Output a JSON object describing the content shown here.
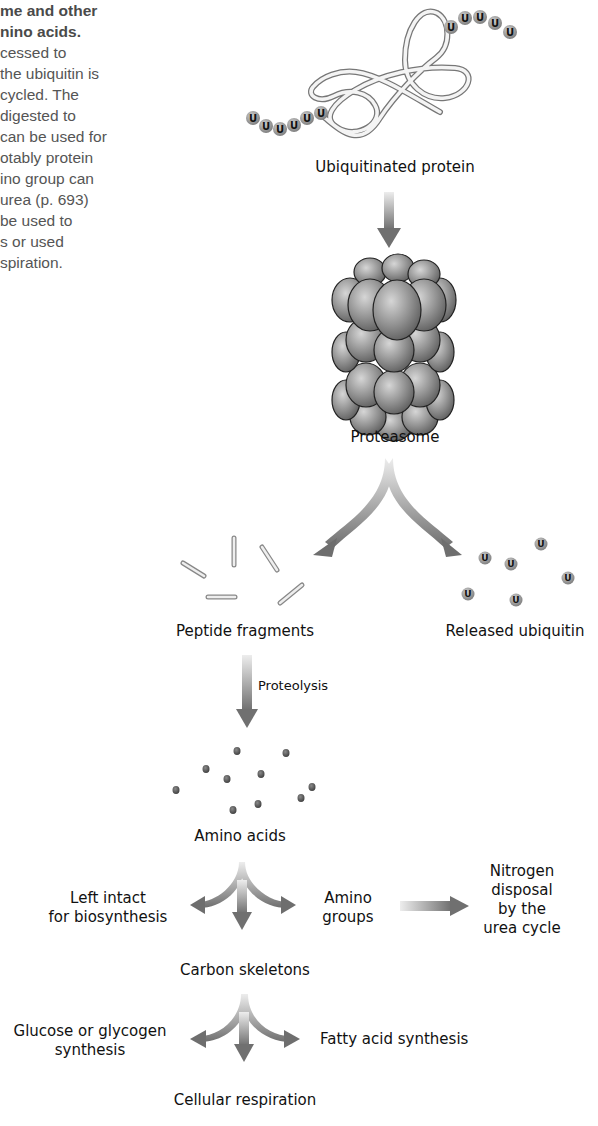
{
  "caption": {
    "lines": [
      {
        "text": "me and other",
        "bold": true
      },
      {
        "text": "nino acids.",
        "bold": true
      },
      {
        "text": "cessed to",
        "bold": false
      },
      {
        "text": " the ubiquitin is",
        "bold": false
      },
      {
        "text": "cycled. The",
        "bold": false
      },
      {
        "text": "digested to",
        "bold": false
      },
      {
        "text": "can be used for",
        "bold": false
      },
      {
        "text": "otably protein",
        "bold": false
      },
      {
        "text": "ino group can",
        "bold": false
      },
      {
        "text": " urea (p. 693)",
        "bold": false
      },
      {
        "text": "be used to",
        "bold": false
      },
      {
        "text": "s or used",
        "bold": false
      },
      {
        "text": "spiration.",
        "bold": false
      }
    ]
  },
  "diagram": {
    "ubiquitin_glyph": "U",
    "labels": {
      "ubiquitinated_protein": "Ubiquitinated protein",
      "proteasome": "Proteasome",
      "peptide_fragments": "Peptide fragments",
      "released_ubiquitin": "Released ubiquitin",
      "proteolysis": "Proteolysis",
      "amino_acids": "Amino acids",
      "left_intact_1": "Left intact",
      "left_intact_2": "for biosynthesis",
      "amino_groups_1": "Amino",
      "amino_groups_2": "groups",
      "nitrogen_1": "Nitrogen",
      "nitrogen_2": "disposal",
      "nitrogen_3": "by the",
      "nitrogen_4": "urea cycle",
      "carbon_skeletons": "Carbon skeletons",
      "glucose_1": "Glucose or glycogen",
      "glucose_2": "synthesis",
      "fatty_acid": "Fatty acid synthesis",
      "cellular_respiration": "Cellular respiration"
    },
    "colors": {
      "arrow_dark": "#6e6e6e",
      "arrow_light": "#e6e6e6",
      "sphere": "#8c8c8c",
      "dot": "#555555"
    }
  }
}
